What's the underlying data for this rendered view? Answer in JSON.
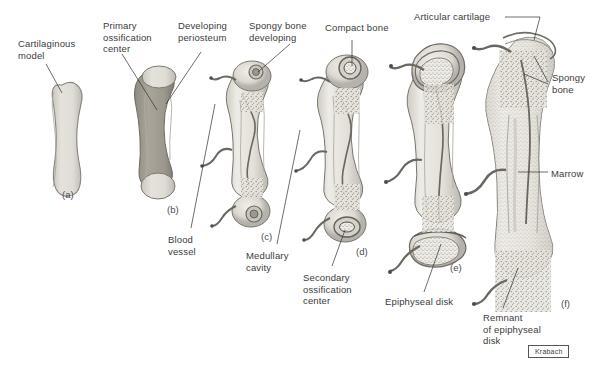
{
  "figure": {
    "credit": "Krabach",
    "background_color": "#ffffff",
    "text_color": "#3b3b3b",
    "leader_color": "#2e2e2e"
  },
  "labels": [
    {
      "id": "cartilaginous-model",
      "text": "Cartilaginous\nmodel",
      "x": 18,
      "y": 38
    },
    {
      "id": "primary-ossification-center",
      "text": "Primary\nossification\ncenter",
      "x": 103,
      "y": 20
    },
    {
      "id": "developing-periosteum",
      "text": "Developing\nperiosteum",
      "x": 178,
      "y": 20
    },
    {
      "id": "spongy-bone-developing",
      "text": "Spongy bone\ndeveloping",
      "x": 249,
      "y": 20
    },
    {
      "id": "compact-bone",
      "text": "Compact bone",
      "x": 325,
      "y": 22
    },
    {
      "id": "articular-cartilage",
      "text": "Articular cartilage",
      "x": 414,
      "y": 11
    },
    {
      "id": "spongy-bone",
      "text": "Spongy\nbone",
      "x": 552,
      "y": 72
    },
    {
      "id": "marrow",
      "text": "Marrow",
      "x": 551,
      "y": 168
    },
    {
      "id": "blood-vessel",
      "text": "Blood\nvessel",
      "x": 168,
      "y": 234
    },
    {
      "id": "medullary-cavity",
      "text": "Medullary\ncavity",
      "x": 246,
      "y": 250
    },
    {
      "id": "secondary-ossification-center",
      "text": "Secondary\nossification\ncenter",
      "x": 303,
      "y": 272
    },
    {
      "id": "epiphyseal-disk",
      "text": "Epiphyseal disk",
      "x": 385,
      "y": 296
    },
    {
      "id": "remnant-of-epiphyseal-disk",
      "text": "Remnant\nof epiphyseal\ndisk",
      "x": 483,
      "y": 312
    }
  ],
  "stages": [
    {
      "id": "a",
      "letter": "(a)",
      "x": 62,
      "y": 189,
      "name": "cartilaginous-model-stage"
    },
    {
      "id": "b",
      "letter": "(b)",
      "x": 167,
      "y": 204,
      "name": "primary-ossification-stage"
    },
    {
      "id": "c",
      "letter": "(c)",
      "x": 261,
      "y": 231,
      "name": "medullary-cavity-stage"
    },
    {
      "id": "d",
      "letter": "(d)",
      "x": 356,
      "y": 246,
      "name": "secondary-ossification-stage"
    },
    {
      "id": "e",
      "letter": "(e)",
      "x": 450,
      "y": 262,
      "name": "epiphyseal-disk-stage"
    },
    {
      "id": "f",
      "letter": "(f)",
      "x": 561,
      "y": 298,
      "name": "mature-bone-stage"
    }
  ],
  "colors": {
    "cartilage_fill": "#dcdad2",
    "cartilage_edge": "#8a887f",
    "bone_shaft": "#9a968c",
    "spongy_fill": "#b8b4aa",
    "compact_ring": "#6f6c64",
    "marrow_fill": "#e8e6e0",
    "vessel": "#55524c"
  }
}
